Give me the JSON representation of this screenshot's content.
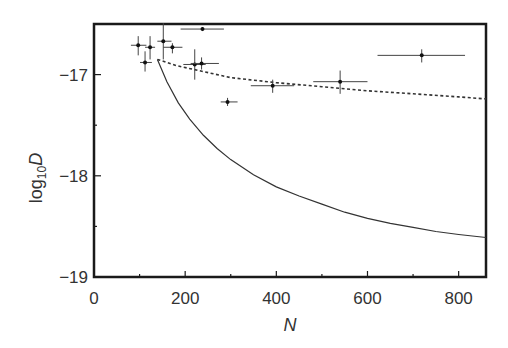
{
  "chart_data": {
    "type": "scatter",
    "title": "",
    "xlabel": "N",
    "ylabel": "log10D",
    "ylabel_parts": {
      "prefix": "log",
      "sub": "10",
      "suffix": "D"
    },
    "xlim": [
      0,
      860
    ],
    "ylim": [
      -19,
      -16.5
    ],
    "xticks": [
      0,
      200,
      400,
      600,
      800
    ],
    "xtick_labels": [
      "0",
      "200",
      "400",
      "600",
      "800"
    ],
    "x_minor_step": 100,
    "yticks": [
      -17,
      -18,
      -19
    ],
    "ytick_labels": [
      "−17",
      "−18",
      "−19"
    ],
    "y_minor_step": 0.5,
    "grid": false,
    "legend": null,
    "series": [
      {
        "name": "measurements",
        "style": "points-with-errorbars",
        "points": [
          {
            "x": 97,
            "y": -16.71,
            "xerr": [
              81,
              115
            ],
            "yerr": [
              -16.62,
              -16.81
            ]
          },
          {
            "x": 123,
            "y": -16.73,
            "xerr": [
              112,
              134
            ],
            "yerr": [
              -16.62,
              -16.85
            ]
          },
          {
            "x": 112,
            "y": -16.88,
            "xerr": [
              101,
              127
            ],
            "yerr": [
              -16.77,
              -16.97
            ]
          },
          {
            "x": 152,
            "y": -16.67,
            "xerr": [
              139,
              170
            ],
            "yerr": [
              -16.49,
              -16.85
            ]
          },
          {
            "x": 172,
            "y": -16.73,
            "xerr": [
              152,
              194
            ],
            "yerr": [
              -16.69,
              -16.79
            ]
          },
          {
            "x": 238,
            "y": -16.55,
            "xerr": [
              190,
              285
            ],
            "yerr": [
              -16.53,
              -16.57
            ]
          },
          {
            "x": 221,
            "y": -16.9,
            "xerr": [
              196,
              245
            ],
            "yerr": [
              -16.75,
              -17.05
            ]
          },
          {
            "x": 236,
            "y": -16.89,
            "xerr": [
              212,
              274
            ],
            "yerr": [
              -16.83,
              -16.95
            ]
          },
          {
            "x": 293,
            "y": -17.27,
            "xerr": [
              278,
              315
            ],
            "yerr": [
              -17.23,
              -17.31
            ]
          },
          {
            "x": 392,
            "y": -17.11,
            "xerr": [
              344,
              439
            ],
            "yerr": [
              -17.05,
              -17.18
            ]
          },
          {
            "x": 540,
            "y": -17.07,
            "xerr": [
              481,
              600
            ],
            "yerr": [
              -16.96,
              -17.19
            ]
          },
          {
            "x": 719,
            "y": -16.81,
            "xerr": [
              622,
              814
            ],
            "yerr": [
              -16.75,
              -16.88
            ]
          }
        ]
      },
      {
        "name": "solid-curve",
        "style": "solid",
        "x": [
          139,
          160,
          185,
          210,
          240,
          270,
          300,
          350,
          400,
          450,
          500,
          550,
          600,
          650,
          700,
          750,
          800,
          860
        ],
        "y": [
          -16.85,
          -17.07,
          -17.28,
          -17.44,
          -17.6,
          -17.73,
          -17.84,
          -17.99,
          -18.11,
          -18.2,
          -18.28,
          -18.36,
          -18.42,
          -18.47,
          -18.51,
          -18.55,
          -18.58,
          -18.61
        ]
      },
      {
        "name": "dashed-curve",
        "style": "dashed",
        "x": [
          139,
          180,
          230,
          300,
          400,
          500,
          600,
          700,
          800,
          860
        ],
        "y": [
          -16.85,
          -16.91,
          -16.96,
          -17.03,
          -17.08,
          -17.12,
          -17.16,
          -17.19,
          -17.22,
          -17.24
        ]
      }
    ]
  }
}
